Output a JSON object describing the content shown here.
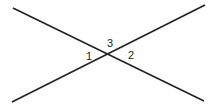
{
  "diagram": {
    "type": "intersecting-lines",
    "lines": [
      {
        "name": "line-a",
        "x1": 13,
        "y1": 8,
        "x2": 204,
        "y2": 101
      },
      {
        "name": "line-b",
        "x1": 12,
        "y1": 102,
        "x2": 205,
        "y2": 5
      }
    ],
    "intersection": {
      "x": 110,
      "y": 54
    },
    "angle_labels": [
      {
        "text": "1",
        "x": 86,
        "y": 60
      },
      {
        "text": "3",
        "x": 107,
        "y": 47
      },
      {
        "text": "2",
        "x": 128,
        "y": 59
      }
    ],
    "stroke_color": "#222222"
  }
}
